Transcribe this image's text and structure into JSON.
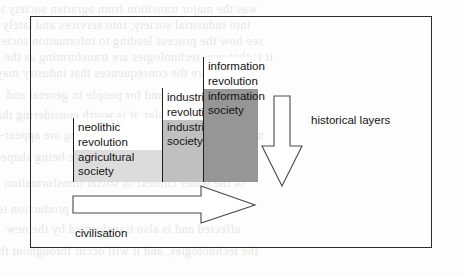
{
  "figure": {
    "border_color": "#2b2b2b",
    "background": "#fdfdfd"
  },
  "columns": [
    {
      "id": "agricultural",
      "revolution_label": "neolithic\nrevolution",
      "revolution_line1": "neolithic",
      "revolution_line2": "revolution",
      "society_line1": "agricultural",
      "society_line2": "society",
      "revolution_fill": "#ffffff",
      "society_fill": "#dcdcdc",
      "left": 73,
      "width": 89,
      "top": 118,
      "bottom": 182,
      "split": 150
    },
    {
      "id": "industrial",
      "revolution_line1": "industrial",
      "revolution_line2": "revolution",
      "society_line1": "industrial",
      "society_line2": "society",
      "revolution_fill": "#ffffff",
      "society_fill": "#c0c0c0",
      "left": 162,
      "width": 41,
      "top": 88,
      "bottom": 182,
      "split": 120
    },
    {
      "id": "information",
      "revolution_line1": "information",
      "revolution_line2": "revolution",
      "society_line1": "information",
      "society_line2": "society",
      "revolution_fill": "#ffffff",
      "society_fill": "#969696",
      "left": 203,
      "width": 55,
      "top": 57,
      "bottom": 182,
      "split": 89
    }
  ],
  "arrows": {
    "historical_layers": {
      "label": "historical layers",
      "direction": "down",
      "icon": "down-arrow-icon"
    },
    "civilisation": {
      "label": "civilisation",
      "direction": "right",
      "icon": "right-arrow-icon"
    }
  },
  "bleed_text": [
    "was the major transition from agrarian society to",
    "into industrial society, into services and lately",
    "see how the process leading to information society",
    "it is that new technologies are transforming as the",
    "what are the consequences that industry may",
    "for the society and for people in general and",
    "so in particular, it is worth considering that",
    "new forms of working and producing are appear-",
    "the new structures of society are being shaped",
    "of the wider context of social transformation",
    "instead. The whole structure of production is",
    "affected and is also transformed by the new",
    "the technologies, and it will occur throughout the"
  ]
}
